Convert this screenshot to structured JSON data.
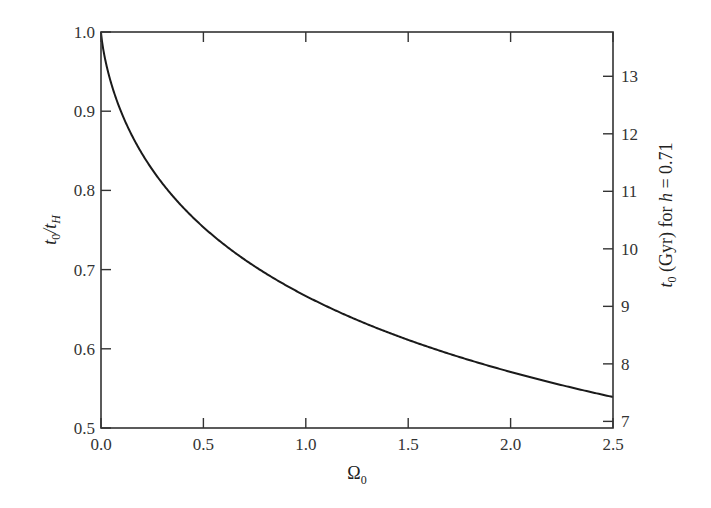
{
  "chart_data": {
    "type": "line",
    "title": "",
    "xlabel": "Ω0",
    "ylabel": "t0/tH",
    "ylabel_right": "t0 (Gyr) for h = 0.71",
    "xlim": [
      0.0,
      2.5
    ],
    "ylim": [
      0.5,
      1.0
    ],
    "ylim_right_ticks_gyr": [
      7,
      8,
      9,
      10,
      11,
      12,
      13
    ],
    "hubble_time_gyr": 13.77,
    "grid": false,
    "legend": null,
    "x_ticks": [
      "0.0",
      "0.5",
      "1.0",
      "1.5",
      "2.0",
      "2.5"
    ],
    "y_ticks": [
      "0.5",
      "0.6",
      "0.7",
      "0.8",
      "0.9",
      "1.0"
    ],
    "y_right_ticks": [
      "7",
      "8",
      "9",
      "10",
      "11",
      "12",
      "13"
    ],
    "series": [
      {
        "name": "t0/tH vs Ω0 (matter-only universe)",
        "x": [
          0.0,
          0.01,
          0.05,
          0.1,
          0.2,
          0.3,
          0.5,
          0.75,
          1.0,
          1.25,
          1.5,
          1.75,
          2.0,
          2.25,
          2.5
        ],
        "values": [
          1.0,
          0.975,
          0.927,
          0.892,
          0.847,
          0.812,
          0.748,
          0.702,
          0.667,
          0.636,
          0.611,
          0.59,
          0.571,
          0.555,
          0.541
        ]
      }
    ]
  },
  "labels": {
    "x_axis": "Ω",
    "x_axis_sub": "0",
    "y_axis_t": "t",
    "y_axis_sub0": "0",
    "y_axis_slash": "/t",
    "y_axis_subH": "H",
    "y2_t": "t",
    "y2_sub0": "0",
    "y2_rest": " (Gyr) for ",
    "y2_h": "h",
    "y2_eq": " = 0.71"
  }
}
